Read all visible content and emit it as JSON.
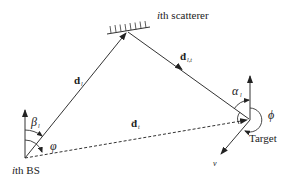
{
  "diagram": {
    "type": "geometry-schematic",
    "nodes": {
      "base_station": {
        "label_prefix": "i",
        "label_suffix": "th BS"
      },
      "scatterer": {
        "label_prefix": "i",
        "label_suffix": "th scatterer"
      },
      "target": {
        "label": "Target"
      }
    },
    "vectors": {
      "d_l": {
        "symbol": "d",
        "subscript": "l",
        "from": "base_station",
        "to": "scatterer"
      },
      "d_lt": {
        "symbol": "d",
        "subscript": "l,t",
        "from": "scatterer",
        "to": "target"
      },
      "d_t": {
        "symbol": "d",
        "subscript": "t",
        "from": "base_station",
        "to": "target",
        "style": "dashed"
      }
    },
    "angles": {
      "beta": {
        "symbol": "β",
        "subscript": "l"
      },
      "varphi": {
        "symbol": "φ"
      },
      "alpha": {
        "symbol": "α",
        "subscript": "l"
      },
      "phi": {
        "symbol": "ϕ"
      }
    },
    "velocity": {
      "symbol": "v"
    },
    "colors": {
      "stroke": "#333333",
      "text": "#222222",
      "background": "#ffffff"
    }
  }
}
